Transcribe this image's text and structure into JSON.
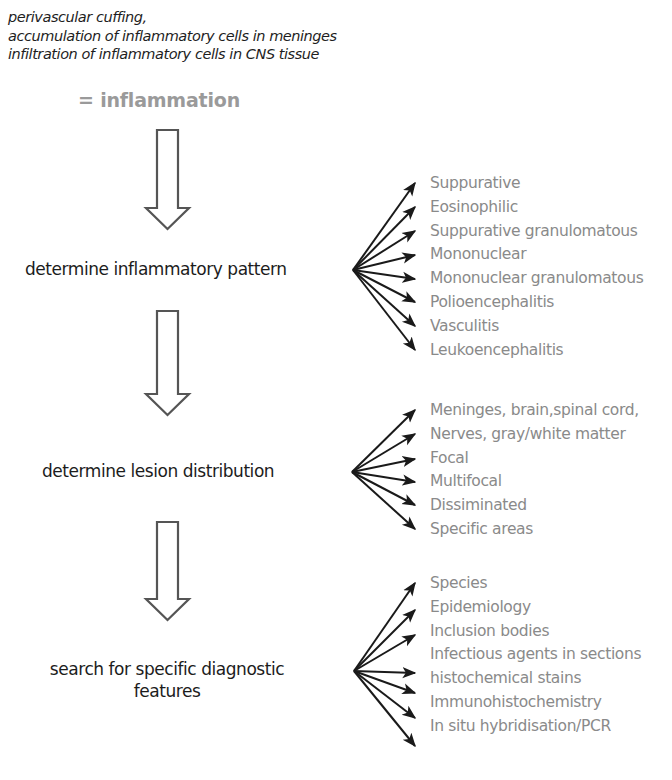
{
  "intro": {
    "lines": [
      "perivascular cuffing,",
      "accumulation of inflammatory cells in meninges",
      "infiltration of inflammatory cells in CNS tissue"
    ],
    "result": "= inflammation"
  },
  "steps": [
    {
      "label": "determine inflammatory pattern",
      "options": [
        "Suppurative",
        "Eosinophilic",
        "Suppurative granulomatous",
        "Mononuclear",
        "Mononuclear granulomatous",
        "Polioencephalitis",
        "Vasculitis",
        "Leukoencephalitis"
      ]
    },
    {
      "label": "determine lesion distribution",
      "options": [
        "Meninges, brain,spinal cord,",
        "Nerves, gray/white matter",
        "Focal",
        "Multifocal",
        "Dissiminated",
        "Specific areas"
      ]
    },
    {
      "label_line1": "search for specific diagnostic",
      "label_line2": "features",
      "options": [
        "Species",
        "Epidemiology",
        "Inclusion bodies",
        "Infectious agents in sections",
        "histochemical  stains",
        "Immunohistochemistry",
        "In situ hybridisation/PCR"
      ]
    }
  ],
  "colors": {
    "main_text": "#1c1c1c",
    "option_text": "#8a8a8a",
    "result_text": "#9a9a9a",
    "arrow_stroke": "#555555"
  }
}
